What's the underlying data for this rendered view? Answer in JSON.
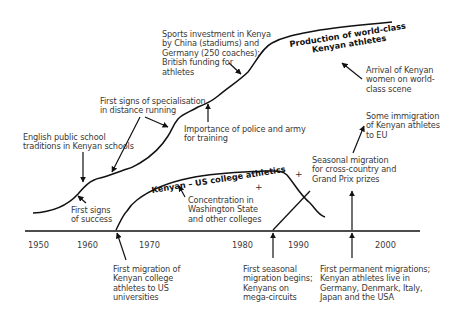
{
  "timeline": {
    "years": [
      "1950",
      "1960",
      "1970",
      "1980",
      "1990",
      "2000"
    ]
  },
  "curves": {
    "world_class": "Production of world-class\nKenyan athletes",
    "us_college": "Kenyan – US college athletics"
  },
  "annotations": {
    "sports_investment": "Sports investment in Kenya\nby China (stadiums) and\nGermany (250 coaches);\nBritish funding for\nathletes",
    "arrival_women": "Arrival of Kenyan\nwomen on world-\nclass scene",
    "specialisation": "First signs of specialisation\nin distance running",
    "police_army": "Importance of police and army\nfor training",
    "english_schools": "English public school\ntraditions in Kenyan schools",
    "first_success": "First signs\nof success",
    "concentration": "Concentration in\nWashington State\nand other colleges",
    "eu_immigration": "Some immigration\nof Kenyan athletes\nto EU",
    "seasonal_crosscountry": "Seasonal migration\nfor cross-country and\nGrand Prix prizes",
    "first_migration_us": "First migration of\nKenyan college\nathletes to US\nuniversities",
    "first_seasonal": "First seasonal\nmigration begins;\nKenyans on\nmega-circuits",
    "first_permanent": "First permanent migrations;\nKenyan athletes live in\nGermany, Denmark, Italy,\nJapan and the USA"
  },
  "colors": {
    "line": "#111111",
    "text": "#3a3a3a"
  }
}
